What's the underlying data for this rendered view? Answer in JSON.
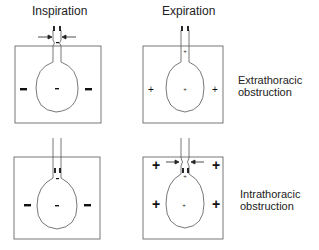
{
  "columns": {
    "inspiration": "Inspiration",
    "expiration": "Expiration"
  },
  "rows": {
    "extrathoracic": {
      "line1": "Extrathoracic",
      "line2": "obstruction"
    },
    "intrathoracic": {
      "line1": "Intrathoracic",
      "line2": "obstruction"
    }
  },
  "signs": {
    "negative": "−",
    "positive": "+"
  },
  "colors": {
    "line": "#555555",
    "ink": "#111111"
  }
}
